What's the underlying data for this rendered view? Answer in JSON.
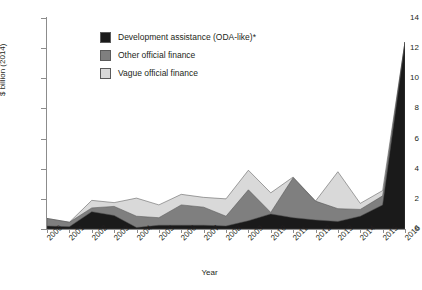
{
  "chart_data": {
    "type": "area",
    "stacked": true,
    "title": "",
    "xlabel": "Year",
    "ylabel": "$ billion (2014)",
    "categories": [
      "2000",
      "2001",
      "2002",
      "2003",
      "2004",
      "2005",
      "2006",
      "2007",
      "2008",
      "2009",
      "2010",
      "2011",
      "2012",
      "2013",
      "2014",
      "2015",
      "2016"
    ],
    "x": [
      2000,
      2001,
      2002,
      2003,
      2004,
      2005,
      2006,
      2007,
      2008,
      2009,
      2010,
      2011,
      2012,
      2013,
      2014,
      2015,
      2016
    ],
    "xlim": [
      2000,
      2016
    ],
    "ylim": [
      0,
      14
    ],
    "yticks": [
      0,
      2,
      4,
      6,
      8,
      10,
      12,
      14
    ],
    "ytick_labels": [
      "0",
      "2",
      "4",
      "6",
      "8",
      "10",
      "12",
      "14"
    ],
    "grid": false,
    "legend_position": "upper-left-inside",
    "series": [
      {
        "name": "Development assistance (ODA-like)*",
        "color": "#1a1a1a",
        "values": [
          0.2,
          0.15,
          1.15,
          0.9,
          0.1,
          0.25,
          0.25,
          0.25,
          0.2,
          0.55,
          1.0,
          0.75,
          0.6,
          0.5,
          0.85,
          1.6,
          12.4
        ]
      },
      {
        "name": "Other official finance",
        "color": "#7f7f7f",
        "values": [
          0.5,
          0.3,
          0.25,
          0.6,
          0.75,
          0.5,
          1.35,
          1.2,
          0.65,
          2.05,
          0.1,
          2.65,
          1.25,
          0.85,
          0.45,
          0.6,
          0.0
        ]
      },
      {
        "name": "Vague official finance",
        "color": "#d9d9d9",
        "values": [
          0.0,
          0.0,
          0.5,
          0.25,
          1.2,
          0.85,
          0.7,
          0.65,
          1.15,
          1.3,
          1.3,
          0.05,
          0.0,
          2.45,
          0.4,
          0.35,
          0.0
        ]
      }
    ],
    "totals": [
      0.7,
      0.45,
      1.9,
      1.75,
      2.05,
      1.6,
      2.3,
      2.1,
      2.0,
      3.9,
      2.4,
      3.45,
      1.85,
      3.8,
      1.7,
      2.55,
      12.4
    ]
  },
  "legend": {
    "items": [
      {
        "label": "Development assistance (ODA-like)*",
        "color": "#1a1a1a"
      },
      {
        "label": "Other official finance",
        "color": "#7f7f7f"
      },
      {
        "label": "Vague official finance",
        "color": "#d9d9d9"
      }
    ]
  },
  "axes": {
    "y_title": "$ billion (2014)",
    "x_title": "Year",
    "y_tick_labels": [
      "14",
      "12",
      "10",
      "8",
      "6",
      "4",
      "2",
      "0"
    ],
    "x_tick_labels": [
      "2000",
      "2001",
      "2002",
      "2003",
      "2004",
      "2005",
      "2006",
      "2007",
      "2008",
      "2009",
      "2010",
      "2011",
      "2012",
      "2013",
      "2014",
      "2015",
      "2016"
    ]
  },
  "colors": {
    "axis": "#8c8c8c",
    "text": "#231f20",
    "background": "#ffffff",
    "series_dark": "#1a1a1a",
    "series_mid": "#7f7f7f",
    "series_light": "#d9d9d9"
  }
}
